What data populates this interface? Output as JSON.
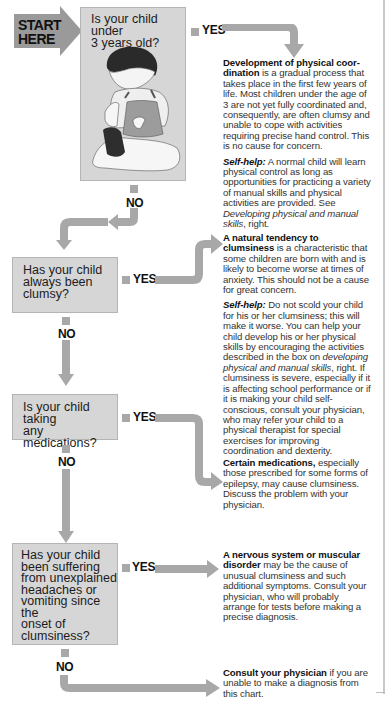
{
  "start": {
    "line1": "START",
    "line2": "HERE"
  },
  "colors": {
    "box": "#d6d6d6",
    "arrow": "#a8a8a8",
    "start": "#9a9a9a",
    "text": "#1a1a1a"
  },
  "labels": {
    "yes": "YES",
    "no": "NO"
  },
  "questions": [
    {
      "id": "q1",
      "text": "Is your child under 3 years old?",
      "lines": [
        "Is your child under",
        "3 years old?"
      ],
      "has_illustration": true,
      "illustration": "seated-toddler-pulling-sock"
    },
    {
      "id": "q2",
      "text": "Has your child always been clumsy?",
      "lines": [
        "Has your child",
        "always been",
        "clumsy?"
      ]
    },
    {
      "id": "q3",
      "text": "Is your child taking any medications?",
      "lines": [
        "Is your child taking",
        "any medications?"
      ]
    },
    {
      "id": "q4",
      "text": "Has your child been suffering from unexplained headaches or vomiting since the onset of clumsiness?",
      "lines": [
        "Has your child",
        "been suffering",
        "from unexplained",
        "headaches or",
        "vomiting since the",
        "onset of",
        "clumsiness?"
      ]
    }
  ],
  "answers": [
    {
      "id": "a1",
      "heading": "Development of physical coordination",
      "heading_display": "Development of physical coor-dination",
      "body": " is a gradual process that takes place in the first few years of life. Most children under the age of 3 are not yet fully coordinated and, consequently, are often clumsy and unable to cope with activities requiring precise hand control. This is no cause for concern.",
      "self_help_label": "Self-help:",
      "self_help": " A normal child will learn physical control as long as opportunities for practicing a variety of manual skills and physical activities are provided. See ",
      "self_help_link": "Developing physical and manual skills",
      "self_help_end": ", right."
    },
    {
      "id": "a2",
      "heading": "A natural tendency to clumsiness",
      "body": " is a characteristic that some children are born with and is likely to become worse at times of anxiety. This should not be a cause for great concern.",
      "self_help_label": "Self-help:",
      "self_help": " Do not scold your child for his or her clumsiness; this will make it worse. You can help your child develop his or her physical skills by encouraging the activities described in the box on ",
      "self_help_link": "developing physical and manual skills",
      "self_help_end": ", right. If clumsiness is severe, especially if it is affecting school performance or if it is making your child self-conscious, consult your physician, who may refer your child to a physical therapist for special exercises for improving coordination and dexterity."
    },
    {
      "id": "a3",
      "heading": "Certain medications,",
      "body": " especially those prescribed for some forms of epilepsy, may cause clumsiness. Discuss the problem with your physician."
    },
    {
      "id": "a4",
      "heading": "A nervous system or muscular disorder",
      "body": " may be the cause of unusual clumsiness and such additional symptoms. Consult your physician, who will probably arrange for tests before making a precise diagnosis."
    },
    {
      "id": "a5",
      "heading": "Consult your physician",
      "body": " if you are unable to make a diagnosis from this chart."
    }
  ]
}
